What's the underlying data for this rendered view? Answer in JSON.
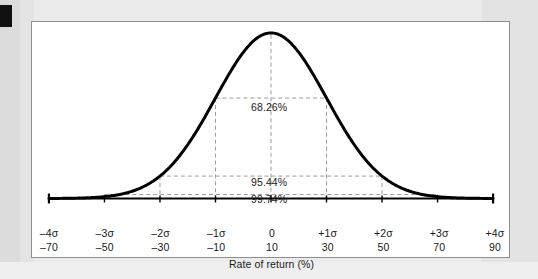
{
  "figure": {
    "corner_tab": "black-corner-tab",
    "frame": "chart-frame"
  },
  "chart_data": {
    "type": "line",
    "title": "",
    "subtitle": "",
    "xlabel": "Rate of return (%)",
    "ylabel": "",
    "grid": false,
    "legend": null,
    "distribution": "normal",
    "mean_rate_of_return": 10,
    "std_dev_rate_of_return": 20,
    "xlim_sigma": [
      -4,
      4
    ],
    "xlim_value": [
      -70,
      90
    ],
    "tick_labels_sigma": [
      "–4σ",
      "–3σ",
      "–2σ",
      "–1σ",
      "0",
      "+1σ",
      "+2σ",
      "+3σ",
      "+4σ"
    ],
    "tick_labels_value": [
      "–70",
      "–50",
      "–30",
      "–10",
      "10",
      "30",
      "50",
      "70",
      "90"
    ],
    "tick_sigma_positions": [
      -4,
      -3,
      -2,
      -1,
      0,
      1,
      2,
      3,
      4
    ],
    "annotations": [
      {
        "label": "68.26%",
        "sigma_range": [
          -1,
          1
        ],
        "level": 1
      },
      {
        "label": "95.44%",
        "sigma_range": [
          -2,
          2
        ],
        "level": 2
      },
      {
        "label": "99.74%",
        "sigma_range": [
          -3,
          3
        ],
        "level": 3
      }
    ],
    "x": [
      -4,
      -3.5,
      -3,
      -2.5,
      -2,
      -1.5,
      -1,
      -0.5,
      0,
      0.5,
      1,
      1.5,
      2,
      2.5,
      3,
      3.5,
      4
    ],
    "y": [
      0.000134,
      0.0009,
      0.0044,
      0.0175,
      0.054,
      0.1295,
      0.242,
      0.3521,
      0.3989,
      0.3521,
      0.242,
      0.1295,
      0.054,
      0.0175,
      0.0044,
      0.0009,
      0.000134
    ]
  },
  "colors": {
    "curve": "#000000",
    "dashed": "#9a9a9a",
    "axis": "#000000",
    "frame_border": "#8d8f91",
    "page_background": "#e8e8e8",
    "plot_background": "#ffffff",
    "text": "#1a1a1a"
  }
}
